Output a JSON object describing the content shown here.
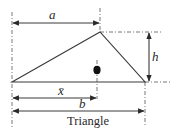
{
  "diagram": {
    "title": "Triangle",
    "labels": {
      "a": "a",
      "h": "h",
      "xbar": "x̄",
      "b": "b"
    },
    "shape": "triangle",
    "vertices": [
      [
        12,
        82
      ],
      [
        100,
        32
      ],
      [
        145,
        82
      ]
    ],
    "centroid_marker": [
      97,
      70
    ],
    "colors": {
      "line": "#3a3a3a",
      "dashed": "#6a6a6a",
      "background": "#ffffff"
    }
  }
}
